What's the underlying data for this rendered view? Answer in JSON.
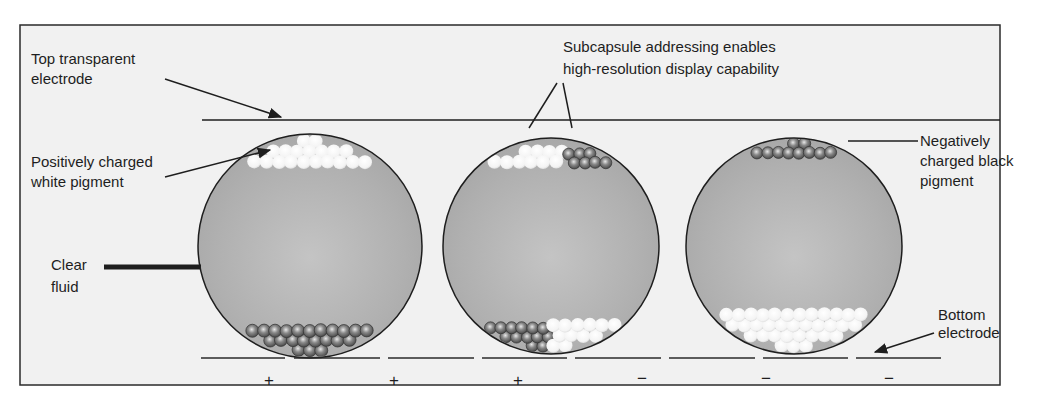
{
  "labels": {
    "top_electrode": [
      "Top transparent",
      "electrode"
    ],
    "white_pigment": [
      "Positively charged",
      "white pigment"
    ],
    "clear_fluid": [
      "Clear",
      "fluid"
    ],
    "subcapsule": [
      "Subcapsule addressing enables",
      "high-resolution display capability"
    ],
    "black_pigment": [
      "Negatively",
      "charged black",
      "pigment"
    ],
    "bottom_electrode": [
      "Bottom",
      "electrode"
    ]
  },
  "electrode_signs": [
    "+",
    "+",
    "+",
    "−",
    "−",
    "−"
  ],
  "capsules": [
    {
      "id": "capsule-1",
      "top": "white",
      "bottom": "black"
    },
    {
      "id": "capsule-2",
      "top": "white-left/black-right",
      "bottom": "black-left/white-right"
    },
    {
      "id": "capsule-3",
      "top": "black",
      "bottom": "white"
    }
  ],
  "colors": {
    "background": "#f1f1f1",
    "fluid": "#b4b4b4",
    "outline": "#1e1e1e",
    "white_pigment": "#fbfbfb",
    "black_pigment": "#7a7a7a"
  }
}
